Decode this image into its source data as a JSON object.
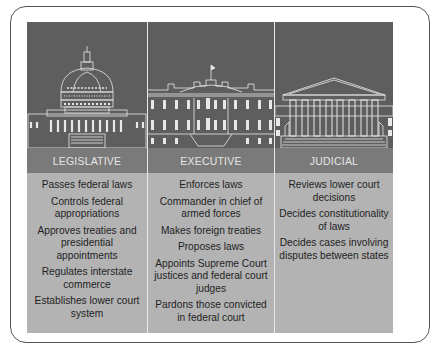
{
  "diagram": {
    "branches": [
      {
        "title": "LEGISLATIVE",
        "building_icon": "capitol-building-icon",
        "powers": [
          "Passes federal laws",
          "Controls federal appropriations",
          "Approves treaties and presidential appointments",
          "Regulates interstate commerce",
          "Establishes lower court system"
        ]
      },
      {
        "title": "EXECUTIVE",
        "building_icon": "white-house-icon",
        "powers": [
          "Enforces laws",
          "Commander in chief of armed forces",
          "Makes foreign treaties",
          "Proposes laws",
          "Appoints Supreme Court justices and federal court judges",
          "Pardons those convicted in federal court"
        ]
      },
      {
        "title": "JUDICIAL",
        "building_icon": "supreme-court-icon",
        "powers": [
          "Reviews lower court decisions",
          "Decides constitutionality of laws",
          "Decides cases involving disputes between states"
        ]
      }
    ],
    "colors": {
      "image_bg": "#5e5e5e",
      "header_bg": "#7a7a7a",
      "list_bg": "#b3b3b3",
      "line_art": "#e8e8e8"
    }
  }
}
